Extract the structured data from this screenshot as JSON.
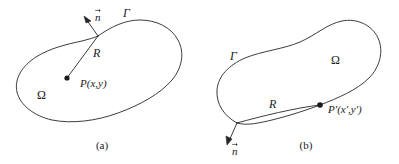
{
  "figure": {
    "stroke_color": "#262626",
    "fill_color": "#ffffff",
    "text_color": "#1a1a1a",
    "width": 399,
    "height": 164
  },
  "panels": [
    {
      "id": "a",
      "caption": "(a)",
      "labels": {
        "boundary": "Γ",
        "domain": "Ω",
        "radius": "R",
        "normal": "n",
        "point": "P(x,y)"
      },
      "point_on_boundary": false
    },
    {
      "id": "b",
      "caption": "(b)",
      "labels": {
        "boundary": "Γ",
        "domain": "Ω",
        "radius": "R",
        "normal": "n",
        "point": "P′(x′,y′)"
      },
      "point_on_boundary": true
    }
  ]
}
